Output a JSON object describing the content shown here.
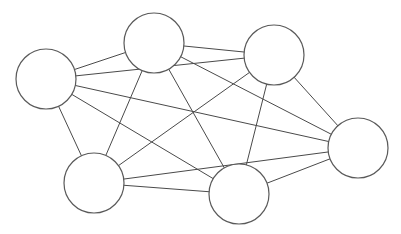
{
  "diagram": {
    "type": "undirected-graph",
    "background": "#ffffff",
    "edge_color": "#4a4a4a",
    "node_stroke": "#5a5a5a",
    "node_fill": "#ffffff",
    "nodes": [
      {
        "id": "A",
        "cx": 46,
        "cy": 79,
        "r": 30
      },
      {
        "id": "B",
        "cx": 154,
        "cy": 43,
        "r": 30
      },
      {
        "id": "C",
        "cx": 274,
        "cy": 55,
        "r": 30
      },
      {
        "id": "D",
        "cx": 94,
        "cy": 183,
        "r": 30
      },
      {
        "id": "E",
        "cx": 239,
        "cy": 194,
        "r": 30
      },
      {
        "id": "F",
        "cx": 358,
        "cy": 148,
        "r": 30
      }
    ],
    "edges": [
      [
        "A",
        "B"
      ],
      [
        "A",
        "C"
      ],
      [
        "A",
        "D"
      ],
      [
        "A",
        "E"
      ],
      [
        "A",
        "F"
      ],
      [
        "B",
        "C"
      ],
      [
        "B",
        "D"
      ],
      [
        "B",
        "E"
      ],
      [
        "B",
        "F"
      ],
      [
        "C",
        "D"
      ],
      [
        "C",
        "E"
      ],
      [
        "C",
        "F"
      ],
      [
        "D",
        "E"
      ],
      [
        "D",
        "F"
      ],
      [
        "E",
        "F"
      ]
    ]
  }
}
